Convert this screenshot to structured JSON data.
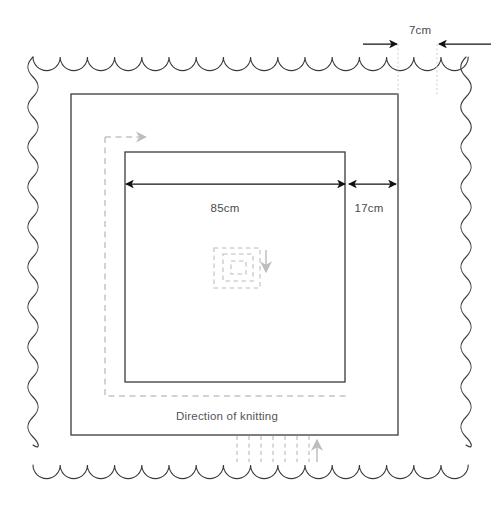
{
  "diagram": {
    "colors": {
      "outline": "#3a3a3f",
      "dimension_line": "#1a1a1a",
      "guide_dotted": "#c8c8c8",
      "knit_path": "#bfbfbf",
      "text": "#4a4a4f"
    },
    "labels": {
      "width_outer_border": "7cm",
      "width_inner_panel": "85cm",
      "width_middle_band": "17cm",
      "direction_caption": "Direction of knitting"
    },
    "shapes": {
      "scalloped_edge": {
        "name": "scalloped-outer-edge",
        "left": 33,
        "top": 57,
        "right": 466,
        "bottom": 465,
        "scallop_period": 27.2,
        "scallop_amplitude": 8
      },
      "middle_square": {
        "name": "middle-square",
        "left": 71,
        "top": 94,
        "right": 398,
        "bottom": 435
      },
      "inner_square": {
        "name": "inner-square",
        "left": 125,
        "top": 152,
        "right": 345,
        "bottom": 382
      },
      "knit_path": {
        "name": "knitting-direction-path",
        "left": 105,
        "top": 137,
        "right": 355,
        "bottom": 396
      },
      "center_spiral": {
        "name": "center-spiral",
        "cx": 240,
        "cy": 264,
        "rings": 3
      }
    },
    "dimensions": {
      "outer_border": {
        "name": "dim-7cm",
        "y": 44,
        "left_arrow_from": 363,
        "left_arrow_to": 399,
        "right_arrow_from": 490,
        "right_arrow_to": 438,
        "label_x": 409,
        "label_y": 34
      },
      "inner_panel": {
        "name": "dim-85cm",
        "y": 184,
        "from": 126,
        "to": 345,
        "label_x": 225,
        "label_y": 212
      },
      "middle_band": {
        "name": "dim-17cm",
        "y": 184,
        "from": 348,
        "to": 396,
        "label_x": 368,
        "label_y": 212
      }
    },
    "comb": {
      "name": "bottom-comb-marks",
      "x_start": 237,
      "x_end": 310,
      "count": 6,
      "top": 436,
      "bottom": 462,
      "arrow_x": 317,
      "arrow_top": 462,
      "arrow_bottom": 438
    }
  }
}
